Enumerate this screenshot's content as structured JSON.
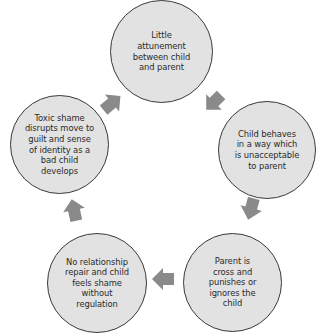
{
  "diagram": {
    "type": "cycle",
    "colors": {
      "node_fill": "#e2e2e2",
      "node_border": "#3a3a3a",
      "arrow": "#8a8a8a",
      "text": "#2a2a2a"
    },
    "nodes": [
      {
        "id": "n1",
        "text": "Little\nattunement\nbetween child\nand parent"
      },
      {
        "id": "n2",
        "text": "Child behaves\nin a way which\nis unacceptable\nto parent"
      },
      {
        "id": "n3",
        "text": "Parent is\ncross and\npunishes or\nignores the\nchild"
      },
      {
        "id": "n4",
        "text": "No relationship\nrepair and child\nfeels shame\nwithout\nregulation"
      },
      {
        "id": "n5",
        "text": "Toxic shame\ndisrupts move to\nguilt and sense\nof identity as a\nbad child\ndevelops"
      }
    ],
    "edges": [
      {
        "from": "n1",
        "to": "n2",
        "icon": "arrow-down-right-icon"
      },
      {
        "from": "n2",
        "to": "n3",
        "icon": "arrow-down-icon"
      },
      {
        "from": "n3",
        "to": "n4",
        "icon": "arrow-left-icon"
      },
      {
        "from": "n4",
        "to": "n5",
        "icon": "arrow-up-icon"
      },
      {
        "from": "n5",
        "to": "n1",
        "icon": "arrow-up-right-icon"
      }
    ]
  }
}
